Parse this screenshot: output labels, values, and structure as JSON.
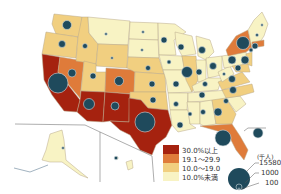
{
  "map": {
    "region": "United States",
    "colors": {
      "c30plus": "#a5220f",
      "c19to29": "#df7b3a",
      "c10to19": "#f1cf80",
      "clt10": "#f8f3c4",
      "bubble": "#1f4a5c",
      "border": "#b9a98a"
    }
  },
  "legend": {
    "color_scale": [
      {
        "label": "30.0%以上",
        "color": "#a5220f"
      },
      {
        "label": "19.1～29.9",
        "color": "#df7b3a"
      },
      {
        "label": "10.0～19.0",
        "color": "#f1cf80"
      },
      {
        "label": "10.0%未満",
        "color": "#f8f3c4"
      }
    ],
    "size_scale": {
      "unit": "(千人)",
      "values": [
        "15580",
        "1000",
        "100"
      ]
    }
  }
}
